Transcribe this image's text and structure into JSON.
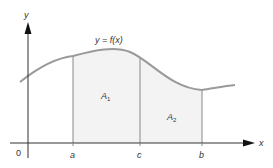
{
  "diagram": {
    "axes": {
      "x_label": "x",
      "y_label": "y",
      "origin_label": "0"
    },
    "curve_label": "y = f(x)",
    "x_ticks": [
      {
        "label": "a",
        "x": 73
      },
      {
        "label": "c",
        "x": 140
      },
      {
        "label": "b",
        "x": 202
      }
    ],
    "regions": [
      {
        "label": "A",
        "subscript": "1",
        "from": "a",
        "to": "c"
      },
      {
        "label": "A",
        "subscript": "2",
        "from": "c",
        "to": "b"
      }
    ],
    "colors": {
      "curve": "#999999",
      "shade": "#f2f2f2",
      "axis": "#222222",
      "lines": "#888888"
    }
  }
}
